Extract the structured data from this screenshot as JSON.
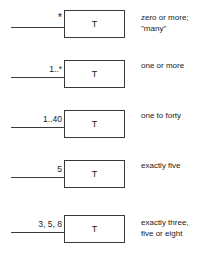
{
  "diagram": {
    "box_label": "T",
    "stroke_color": "#3a3a3a",
    "text_color": "#1a1a1a",
    "background_color": "#ffffff",
    "rows": [
      {
        "multiplicity": "*",
        "description_lines": [
          "zero or more;",
          "\"many\""
        ]
      },
      {
        "multiplicity": "1..*",
        "description_lines": [
          "one or more"
        ]
      },
      {
        "multiplicity": "1..40",
        "description_lines": [
          "one to forty"
        ]
      },
      {
        "multiplicity": "5",
        "description_lines": [
          "exactly five"
        ]
      },
      {
        "multiplicity": "3, 5, 8",
        "description_lines": [
          "exactly three,",
          "five or eight"
        ]
      }
    ]
  }
}
